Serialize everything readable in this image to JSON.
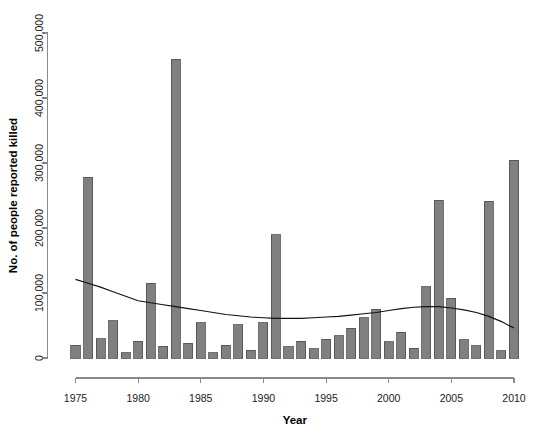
{
  "chart_data": {
    "type": "bar",
    "title": "",
    "xlabel": "Year",
    "ylabel": "No. of people reported killed",
    "xlim": [
      1974.5,
      2010.5
    ],
    "ylim": [
      0,
      520000
    ],
    "grid": false,
    "legend": "none",
    "x_ticks": [
      1975,
      1980,
      1985,
      1990,
      1995,
      2000,
      2005,
      2010
    ],
    "x_tick_labels": [
      "1975",
      "1980",
      "1985",
      "1990",
      "1995",
      "2000",
      "2005",
      "2010"
    ],
    "y_ticks": [
      0,
      100000,
      200000,
      300000,
      400000,
      500000
    ],
    "y_tick_labels": [
      "0",
      "100,000",
      "200,000",
      "300,000",
      "400,000",
      "500,000"
    ],
    "categories": [
      1975,
      1976,
      1977,
      1978,
      1979,
      1980,
      1981,
      1982,
      1983,
      1984,
      1985,
      1986,
      1987,
      1988,
      1989,
      1990,
      1991,
      1992,
      1993,
      1994,
      1995,
      1996,
      1997,
      1998,
      1999,
      2000,
      2001,
      2002,
      2003,
      2004,
      2005,
      2006,
      2007,
      2008,
      2009,
      2010
    ],
    "values": [
      20000,
      278000,
      30000,
      57000,
      8000,
      26000,
      115000,
      18000,
      460000,
      23000,
      54000,
      8000,
      20000,
      51000,
      12000,
      54000,
      190000,
      17000,
      26000,
      14000,
      29000,
      34000,
      46000,
      62000,
      75000,
      25000,
      40000,
      15000,
      110000,
      243000,
      92000,
      28000,
      19000,
      241000,
      11000,
      304000
    ],
    "series": [
      {
        "name": "Smoothed trend",
        "type": "line",
        "x": [
          1975,
          1976,
          1977,
          1978,
          1979,
          1980,
          1981,
          1982,
          1983,
          1984,
          1985,
          1986,
          1987,
          1988,
          1989,
          1990,
          1991,
          1992,
          1993,
          1994,
          1995,
          1996,
          1997,
          1998,
          1999,
          2000,
          2001,
          2002,
          2003,
          2004,
          2005,
          2006,
          2007,
          2008,
          2009,
          2010
        ],
        "values": [
          121000,
          115000,
          109000,
          102000,
          95000,
          88000,
          85000,
          82000,
          79000,
          76000,
          73000,
          70000,
          67000,
          65000,
          63000,
          62000,
          61000,
          61000,
          61000,
          62000,
          63000,
          64000,
          66000,
          68000,
          70000,
          73000,
          76000,
          78000,
          79000,
          79000,
          77000,
          74000,
          70000,
          64000,
          56000,
          46000
        ]
      }
    ],
    "bar_color": "#808080",
    "bar_edge_color": "#4d4d4d",
    "line_color": "#111111",
    "axis_color": "#8a8a8a",
    "background_color": "#ffffff"
  }
}
